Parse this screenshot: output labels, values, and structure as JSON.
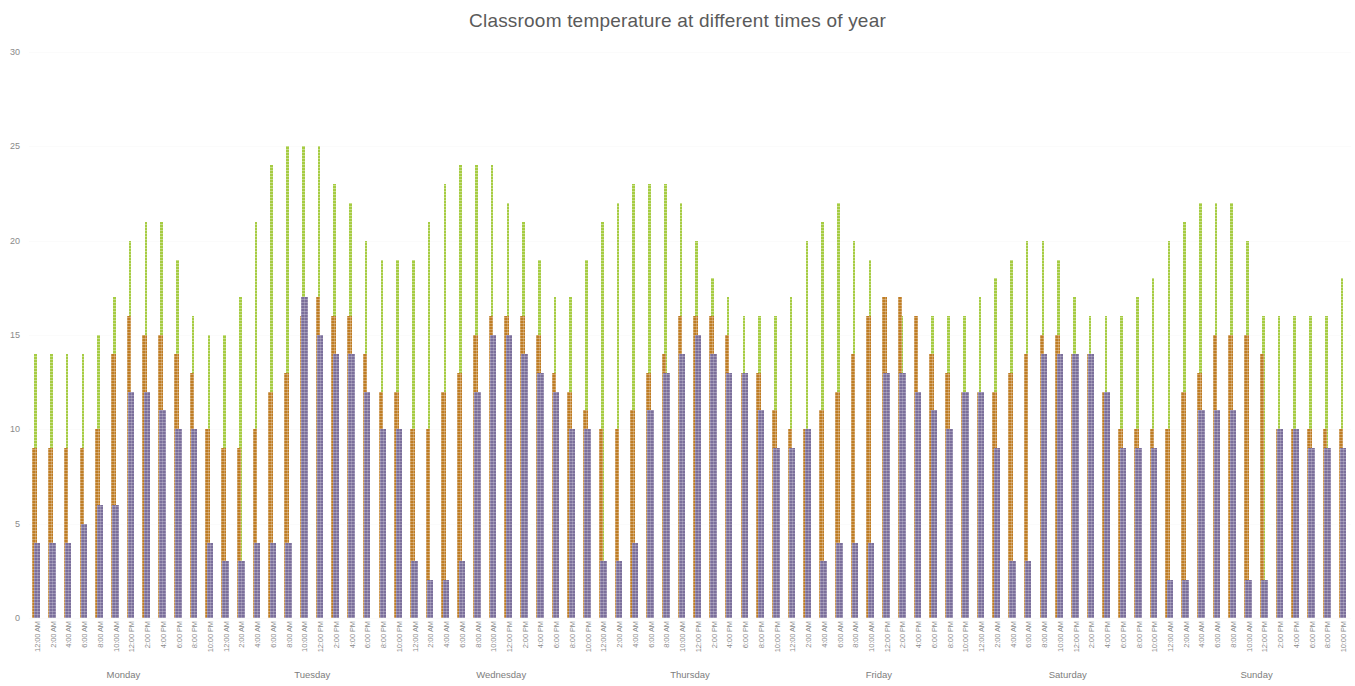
{
  "chart_data": {
    "type": "bar",
    "title": "Classroom temperature at different times of year",
    "xlabel": "",
    "ylabel": "",
    "ylim": [
      0,
      30
    ],
    "yticks": [
      0,
      5,
      10,
      15,
      20,
      25,
      30
    ],
    "grid": true,
    "legend": "none",
    "bar_style": "overlapping",
    "groups": [
      "Monday",
      "Tuesday",
      "Wednesday",
      "Thursday",
      "Friday",
      "Saturday",
      "Sunday"
    ],
    "times": [
      "12:00 AM",
      "2:00 AM",
      "4:00 AM",
      "6:00 AM",
      "8:00 AM",
      "10:00 AM",
      "12:00 PM",
      "2:00 PM",
      "4:00 PM",
      "6:00 PM",
      "8:00 PM",
      "10:00 PM"
    ],
    "categories": [
      "12:00 AM",
      "2:00 AM",
      "4:00 AM",
      "6:00 AM",
      "8:00 AM",
      "10:00 AM",
      "12:00 PM",
      "2:00 PM",
      "4:00 PM",
      "6:00 PM",
      "8:00 PM",
      "10:00 PM",
      "12:00 AM",
      "2:00 AM",
      "4:00 AM",
      "6:00 AM",
      "8:00 AM",
      "10:00 AM",
      "12:00 PM",
      "2:00 PM",
      "4:00 PM",
      "6:00 PM",
      "8:00 PM",
      "10:00 PM",
      "12:00 AM",
      "2:00 AM",
      "4:00 AM",
      "6:00 AM",
      "8:00 AM",
      "10:00 AM",
      "12:00 PM",
      "2:00 PM",
      "4:00 PM",
      "6:00 PM",
      "8:00 PM",
      "10:00 PM",
      "12:00 AM",
      "2:00 AM",
      "4:00 AM",
      "6:00 AM",
      "8:00 AM",
      "10:00 AM",
      "12:00 PM",
      "2:00 PM",
      "4:00 PM",
      "6:00 PM",
      "8:00 PM",
      "10:00 PM",
      "12:00 AM",
      "2:00 AM",
      "4:00 AM",
      "6:00 AM",
      "8:00 AM",
      "10:00 AM",
      "12:00 PM",
      "2:00 PM",
      "4:00 PM",
      "6:00 PM",
      "8:00 PM",
      "10:00 PM",
      "12:00 AM",
      "2:00 AM",
      "4:00 AM",
      "6:00 AM",
      "8:00 AM",
      "10:00 AM",
      "12:00 PM",
      "2:00 PM",
      "4:00 PM",
      "6:00 PM",
      "8:00 PM",
      "10:00 PM",
      "12:00 AM",
      "2:00 AM",
      "4:00 AM",
      "6:00 AM",
      "8:00 AM",
      "10:00 AM",
      "12:00 PM",
      "2:00 PM",
      "4:00 PM",
      "6:00 PM",
      "8:00 PM",
      "10:00 PM"
    ],
    "colors": {
      "summer_green": "#a6cc43",
      "spring_autumn_orange": "#bf7d25",
      "winter_purple": "#7b6f9b",
      "gridline": "#fbfbfb",
      "title_text": "#5a5a5a",
      "tick_text": "#8a8a8a"
    },
    "series": [
      {
        "name": "summer",
        "color": "#a6cc43",
        "values": [
          14,
          14,
          14,
          14,
          15,
          17,
          20,
          21,
          21,
          19,
          16,
          15,
          15,
          17,
          21,
          24,
          25,
          25,
          25,
          23,
          22,
          20,
          19,
          19,
          19,
          21,
          23,
          24,
          24,
          24,
          22,
          21,
          19,
          17,
          17,
          19,
          21,
          22,
          23,
          23,
          23,
          22,
          20,
          18,
          17,
          16,
          16,
          16,
          17,
          20,
          21,
          22,
          20,
          19,
          17,
          16,
          16,
          16,
          16,
          16,
          17,
          18,
          19,
          20,
          20,
          19,
          17,
          16,
          16,
          16,
          17,
          18,
          20,
          21,
          22,
          22,
          22,
          20,
          16,
          16,
          16,
          16,
          16,
          18
        ]
      },
      {
        "name": "spring_autumn",
        "color": "#bf7d25",
        "values": [
          9,
          9,
          9,
          9,
          10,
          14,
          16,
          15,
          15,
          14,
          13,
          10,
          9,
          9,
          10,
          12,
          13,
          16,
          17,
          16,
          16,
          14,
          12,
          12,
          10,
          10,
          12,
          13,
          15,
          16,
          16,
          16,
          15,
          13,
          12,
          11,
          10,
          10,
          11,
          13,
          14,
          16,
          16,
          16,
          15,
          13,
          13,
          11,
          10,
          10,
          11,
          12,
          14,
          16,
          17,
          17,
          16,
          14,
          13,
          12,
          12,
          12,
          13,
          14,
          15,
          15,
          14,
          14,
          12,
          10,
          10,
          10,
          10,
          12,
          13,
          15,
          15,
          15,
          14,
          10,
          10,
          10,
          10,
          10
        ]
      },
      {
        "name": "winter",
        "color": "#7b6f9b",
        "values": [
          4,
          4,
          4,
          5,
          6,
          6,
          12,
          12,
          11,
          10,
          10,
          4,
          3,
          3,
          4,
          4,
          4,
          17,
          15,
          14,
          14,
          12,
          10,
          10,
          3,
          2,
          2,
          3,
          12,
          15,
          15,
          14,
          13,
          12,
          10,
          10,
          3,
          3,
          4,
          11,
          13,
          14,
          15,
          14,
          13,
          13,
          11,
          9,
          9,
          10,
          3,
          4,
          4,
          4,
          13,
          13,
          12,
          11,
          10,
          12,
          12,
          9,
          3,
          3,
          14,
          14,
          14,
          14,
          12,
          9,
          9,
          9,
          2,
          2,
          11,
          11,
          11,
          2,
          2,
          10,
          10,
          9,
          9,
          9
        ]
      }
    ]
  }
}
